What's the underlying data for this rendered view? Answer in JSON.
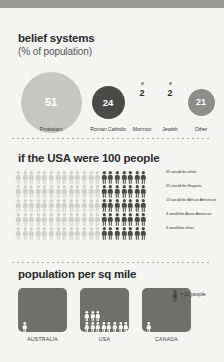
{
  "colors": {
    "page_bg": "#f2f2f0",
    "card_bg": "#f4f4f2",
    "top_bar": "#9a9a99",
    "bubble_light": "#c6c6c4",
    "bubble_dark": "#4a4a48",
    "bubble_mid": "#8d8d8b",
    "figure_light": "#cfcfcd",
    "figure_dark": "#4a4a48",
    "box_fill": "#6f6f6d",
    "text_dark": "#2b2b2b",
    "text_mid": "#3a3a38",
    "dotted_rule": "#a8a8a6"
  },
  "belief": {
    "title": "belief systems",
    "subtitle": "(% of population)",
    "items": [
      {
        "label": "Protestant",
        "value": "51",
        "pct": 51,
        "style": "light"
      },
      {
        "label": "Roman Catholic",
        "value": "24",
        "pct": 24,
        "style": "dark"
      },
      {
        "label": "Mormon",
        "value": "2",
        "pct": 2,
        "style": "dot"
      },
      {
        "label": "Jewish",
        "value": "2",
        "pct": 2,
        "style": "dot"
      },
      {
        "label": "Other",
        "value": "21",
        "pct": 21,
        "style": "mid"
      }
    ]
  },
  "people": {
    "title": "if the USA were 100 people",
    "total_figures": 100,
    "per_row": 20,
    "rows": 5,
    "light_per_row": 13,
    "dark_per_row": 7,
    "breakdown": [
      {
        "count": 65,
        "text": "65 would be white"
      },
      {
        "count": 15,
        "text": "15 would be Hispanic"
      },
      {
        "count": 13,
        "text": "13 would be African American"
      },
      {
        "count": 4,
        "text": "4 would be Asian American"
      },
      {
        "count": 3,
        "text": "3 would be other"
      }
    ]
  },
  "population": {
    "title": "population per sq mile",
    "legend_text": "= 11 people",
    "legend_unit": 11,
    "countries": [
      {
        "label": "AUSTRALIA",
        "figures": 1,
        "rows": [
          1
        ]
      },
      {
        "label": "USA",
        "figures": 11,
        "rows": [
          3,
          8
        ]
      },
      {
        "label": "CANADA",
        "figures": 1,
        "rows": [
          1
        ]
      }
    ]
  },
  "chart_data": [
    {
      "type": "pie",
      "title": "belief systems (% of population)",
      "categories": [
        "Protestant",
        "Roman Catholic",
        "Mormon",
        "Jewish",
        "Other"
      ],
      "values": [
        51,
        24,
        2,
        2,
        21
      ],
      "ylabel": "% of population"
    },
    {
      "type": "bar",
      "title": "if the USA were 100 people",
      "categories": [
        "white",
        "Hispanic",
        "African American",
        "Asian American",
        "other"
      ],
      "values": [
        65,
        15,
        13,
        4,
        3
      ],
      "ylabel": "people per 100"
    },
    {
      "type": "bar",
      "title": "population per sq mile",
      "categories": [
        "AUSTRALIA",
        "USA",
        "CANADA"
      ],
      "values": [
        11,
        121,
        11
      ],
      "ylabel": "people per sq mile"
    }
  ]
}
